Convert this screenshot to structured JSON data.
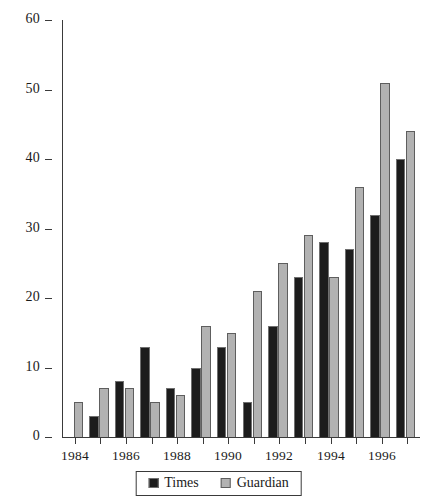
{
  "chart_data": {
    "type": "bar",
    "title": "",
    "subtitle": "",
    "xlabel": "",
    "ylabel": "",
    "ylim": [
      0,
      60
    ],
    "ytick_values": [
      0,
      10,
      20,
      30,
      40,
      50,
      60
    ],
    "ytick_labels": [
      "0",
      "10",
      "20",
      "30",
      "40",
      "50",
      "60"
    ],
    "grid": false,
    "legend_position": "bottom-center",
    "categories": [
      "1984",
      "1985",
      "1986",
      "1987",
      "1988",
      "1989",
      "1990",
      "1991",
      "1992",
      "1993",
      "1994",
      "1995",
      "1996",
      "1997"
    ],
    "xtick_labels": [
      "1984",
      "1986",
      "1988",
      "1990",
      "1992",
      "1994",
      "1996"
    ],
    "series": [
      {
        "name": "Times",
        "color": "#1c1c1c",
        "values": [
          0,
          3,
          8,
          13,
          7,
          10,
          13,
          5,
          16,
          23,
          28,
          27,
          32,
          40
        ]
      },
      {
        "name": "Guardian",
        "color": "#b2b2b2",
        "values": [
          5,
          7,
          7,
          5,
          6,
          16,
          15,
          21,
          25,
          29,
          23,
          36,
          51,
          44
        ]
      }
    ]
  },
  "legend": {
    "items": [
      {
        "label": "Times",
        "swatch": "black-square-icon"
      },
      {
        "label": "Guardian",
        "swatch": "gray-square-icon"
      }
    ]
  }
}
